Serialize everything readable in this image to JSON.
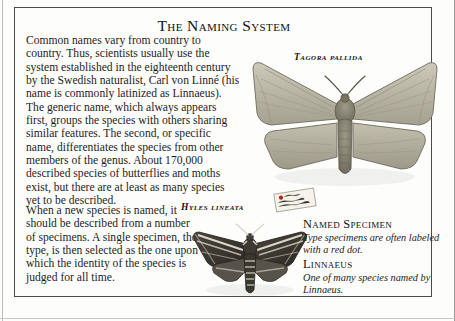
{
  "page": {
    "title": "The Naming System",
    "background_color": "#fdfdfc",
    "frame_color": "#4a4a4a",
    "text_color": "#1d1d1d"
  },
  "body": {
    "paragraph_1": "Common names vary from country to country. Thus, scientists usually use the system established in the eighteenth century by the Swedish naturalist, Carl von Linné (his name is commonly latinized as Linnaeus). The generic name, which always appears first, groups the species with others sharing similar features. The second, or specific name, differentiates the species from other members of the genus. About 170,000 described species of butterflies and moths exist, but there are at least as many species yet to be described.",
    "paragraph_2": "When a new species is named, it should be described from a number of specimens. A single specimen, the type, is then selected as the one upon which the identity of the species is judged for all time."
  },
  "specimens": [
    {
      "id": "tagora",
      "label": "Tagora pallida",
      "icon": "moth-specimen-icon",
      "wing_color": "#b9b5a4",
      "body_color": "#8d8876"
    },
    {
      "id": "hyles",
      "label": "Hyles lineata",
      "icon": "hawk-moth-specimen-icon",
      "wing_color": "#3b3830",
      "stripe_color": "#e8e4d8"
    }
  ],
  "specimen_label": {
    "icon": "specimen-tag-icon",
    "dot_color": "#b3261e"
  },
  "captions": [
    {
      "heading": "Named Specimen",
      "text": "Type specimens are often labeled with a red dot."
    },
    {
      "heading": "Linnaeus",
      "text": "One of many species named by Linnaeus."
    }
  ]
}
